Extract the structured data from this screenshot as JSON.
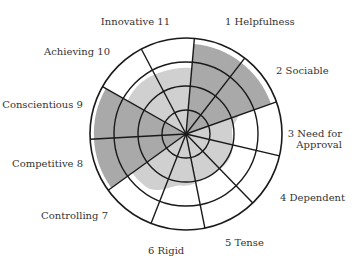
{
  "chart_data": {
    "type": "radar",
    "title": "",
    "center": [
      186,
      134
    ],
    "outer_radius": 96,
    "rings": 4,
    "start_angle_deg": 5,
    "categories": [
      "Helpfulness",
      "Sociable",
      "Need for Approval",
      "Dependent",
      "Tense",
      "Rigid",
      "Controlling",
      "Competitive",
      "Conscientious",
      "Achieving",
      "Innovative"
    ],
    "numbers": [
      1,
      2,
      3,
      4,
      5,
      6,
      7,
      8,
      9,
      10,
      11
    ],
    "series": [
      {
        "name": "profile",
        "values": [
          0.94,
          0.94,
          0.48,
          0.52,
          0.5,
          0.54,
          0.69,
          0.96,
          0.96,
          0.71,
          0.69
        ],
        "emphasized": [
          true,
          true,
          false,
          false,
          false,
          false,
          false,
          true,
          true,
          false,
          false
        ]
      }
    ],
    "colors": {
      "emphasized": "#a9a9a9",
      "base": "#d0d0d0",
      "grid": "#1a1a1a"
    },
    "labels": [
      {
        "text": "1  Helpfulness",
        "x": 225,
        "y": 25,
        "anchor": "start"
      },
      {
        "text": "2  Sociable",
        "x": 276,
        "y": 74,
        "anchor": "start"
      },
      {
        "text": "3  Need for",
        "x": 342,
        "y": 137,
        "anchor": "end"
      },
      {
        "text": "Approval",
        "x": 342,
        "y": 148,
        "anchor": "end"
      },
      {
        "text": "4  Dependent",
        "x": 280,
        "y": 201,
        "anchor": "start"
      },
      {
        "text": "5  Tense",
        "x": 225,
        "y": 246,
        "anchor": "start"
      },
      {
        "text": "6  Rigid",
        "x": 148,
        "y": 254,
        "anchor": "start"
      },
      {
        "text": "Controlling  7",
        "x": 108,
        "y": 219,
        "anchor": "end"
      },
      {
        "text": "Competitive  8",
        "x": 83,
        "y": 167,
        "anchor": "end"
      },
      {
        "text": "Conscientious  9",
        "x": 83,
        "y": 108,
        "anchor": "end"
      },
      {
        "text": "Achieving  10",
        "x": 110,
        "y": 55,
        "anchor": "end"
      },
      {
        "text": "Innovative  11",
        "x": 170,
        "y": 25,
        "anchor": "end"
      }
    ]
  }
}
